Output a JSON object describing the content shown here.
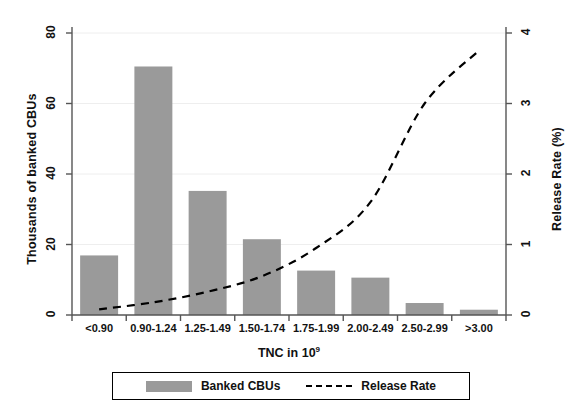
{
  "chart_data": {
    "type": "bar",
    "title": "",
    "xlabel": "TNC in 10⁹",
    "xlabel_base": "TNC in 10",
    "xlabel_exp": "9",
    "ylabel": "Thousands of banked CBUs",
    "ylabel_right": "Release Rate (%)",
    "categories": [
      "<0.90",
      "0.90-1.24",
      "1.25-1.49",
      "1.50-1.74",
      "1.75-1.99",
      "2.00-2.49",
      "2.50-2.99",
      ">3.00"
    ],
    "ylim": [
      0,
      80
    ],
    "ylim_right": [
      0,
      4
    ],
    "yticks": [
      "0",
      "20",
      "40",
      "60",
      "80"
    ],
    "ytick_values": [
      0,
      20,
      40,
      60,
      80
    ],
    "yticks_right": [
      "0",
      "1",
      "2",
      "3",
      "4"
    ],
    "ytick_values_right": [
      0,
      1,
      2,
      3,
      4
    ],
    "grid": true,
    "legend_position": "bottom",
    "series": [
      {
        "name": "Banked CBUs",
        "type": "bar",
        "axis": "left",
        "color": "#9a9a9a",
        "values": [
          16.9,
          70.5,
          35.2,
          21.5,
          12.6,
          10.6,
          3.4,
          1.5
        ]
      },
      {
        "name": "Release Rate",
        "type": "line",
        "axis": "right",
        "color": "#000000",
        "style": "dashed",
        "values": [
          0.08,
          0.18,
          0.33,
          0.55,
          0.95,
          1.6,
          3.0,
          3.75
        ]
      }
    ]
  },
  "legend": {
    "items": [
      {
        "label": "Banked CBUs",
        "marker": "swatch"
      },
      {
        "label": "Release Rate",
        "marker": "dashed-line"
      }
    ]
  },
  "colors": {
    "bar": "#9a9a9a",
    "line": "#000000",
    "axis": "#555555",
    "grid": "#eeeeee",
    "background": "#ffffff"
  }
}
